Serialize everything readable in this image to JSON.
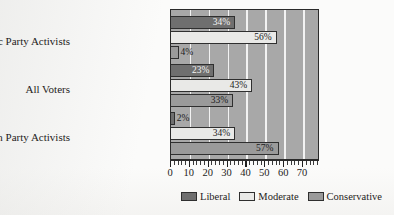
{
  "chart_data": {
    "type": "bar",
    "orientation": "horizontal",
    "title": "",
    "xlabel": "",
    "ylabel": "",
    "categories": [
      "Democratic Party Activists",
      "All Voters",
      "Republican Party Activists"
    ],
    "series": [
      {
        "name": "Liberal",
        "color": "#6f6f6f",
        "values": [
          34,
          23,
          2
        ],
        "labels": [
          "34%",
          "23%",
          "2%"
        ]
      },
      {
        "name": "Moderate",
        "color": "#e9e9e7",
        "values": [
          56,
          43,
          34
        ],
        "labels": [
          "56%",
          "43%",
          "34%"
        ]
      },
      {
        "name": "Conservative",
        "color": "#9a9a9a",
        "values": [
          4,
          33,
          57
        ],
        "labels": [
          "4%",
          "33%",
          "57%"
        ]
      }
    ],
    "xlim": [
      0,
      79
    ],
    "xticks": [
      0,
      10,
      20,
      30,
      40,
      50,
      60,
      70
    ],
    "xtick_labels": [
      "0",
      "10",
      "20",
      "30",
      "40",
      "50",
      "60",
      "70"
    ],
    "minor_tick_interval": 2,
    "grid": "vertical",
    "gridlines_at": [
      10,
      20,
      30,
      40,
      50,
      60,
      70
    ],
    "legend_position": "bottom",
    "plot_background": "#a8a8a8",
    "gridline_color": "#f2f2f2"
  },
  "legend": {
    "items": [
      {
        "label": "Liberal"
      },
      {
        "label": "Moderate"
      },
      {
        "label": "Conservative"
      }
    ]
  }
}
